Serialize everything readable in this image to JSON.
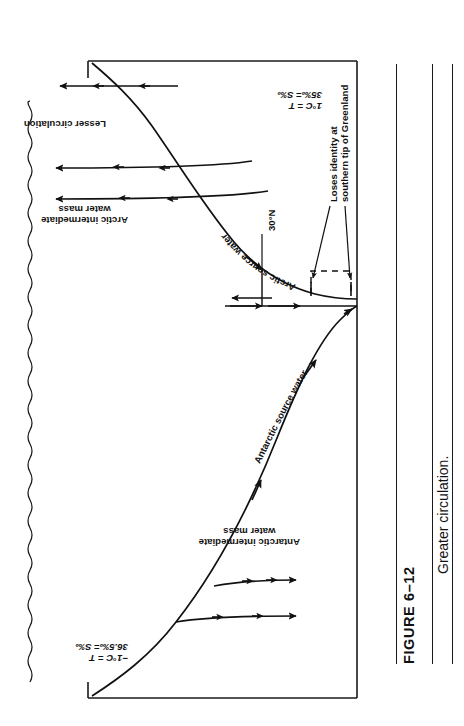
{
  "figure": {
    "number": "FIGURE 6–12",
    "caption": "Greater circulation."
  },
  "diagram": {
    "title": "Greater circulation",
    "kind": "ocean-circulation-cross-section",
    "surface_label": "sea surface (wavy line)",
    "labels": {
      "lesser_circulation": "Lesser circulation",
      "arctic_temp_salinity": "1°C = T\n35‰= S‰",
      "antarctic_temp_salinity": "−1°C = T\n36.5‰= S‰",
      "arctic_intermediate": "Arctic intermediate\nwater mass",
      "antarctic_intermediate": "Antarctic intermediate\nwater mass",
      "arctic_source_water": "Arctic source water",
      "antarctic_source_water": "Antarctic source water",
      "latitude_marker": "30°N",
      "loses_identity": "Loses identity at\nsouthern tip of Greenland"
    }
  },
  "style": {
    "ink": "#111111",
    "frame": "#1a1a1a",
    "paper": "#ffffff"
  }
}
